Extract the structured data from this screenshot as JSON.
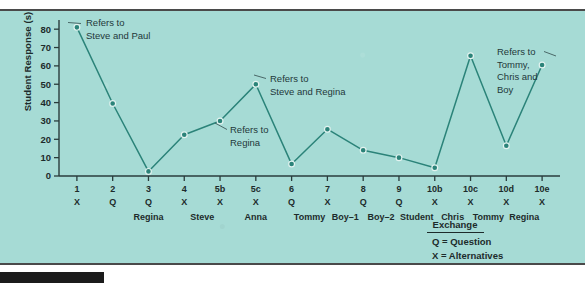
{
  "figure": {
    "background_color": "#a6dbd5",
    "line_color": "#2b8379",
    "text_color": "#1d2b2b"
  },
  "chart_data": {
    "type": "line",
    "title": "",
    "xlabel": "",
    "ylabel": "Student Response (s)",
    "ylim": [
      0,
      85
    ],
    "yticks": [
      0,
      10,
      20,
      30,
      40,
      50,
      60,
      70,
      80
    ],
    "grid": false,
    "legend_position": "bottom-right",
    "categories": [
      "1",
      "2",
      "3",
      "4",
      "5b",
      "5c",
      "6",
      "7",
      "8",
      "9",
      "10b",
      "10c",
      "10d",
      "10e"
    ],
    "values": [
      81,
      39.5,
      2.5,
      22.5,
      30,
      50,
      6.5,
      25.5,
      14,
      10,
      4.5,
      65.5,
      16.5,
      60.5
    ],
    "exchange_types": [
      "X",
      "Q",
      "Q",
      "X",
      "X",
      "X",
      "Q",
      "X",
      "Q",
      "Q",
      "X",
      "X",
      "X",
      "X"
    ],
    "speakers": [
      "",
      "",
      "Regina",
      "",
      "Steve",
      "",
      "Anna",
      "Tommy",
      "Boy–1",
      "Boy–2",
      "Student",
      "Chris",
      "Tommy",
      "Regina"
    ],
    "speaker_groups": [
      {
        "label": "Regina",
        "center_category": 2.5
      },
      {
        "label": "Steve",
        "center_category": 4
      },
      {
        "label": "Anna",
        "center_category": 5.5
      },
      {
        "label": "Tommy",
        "center_category": 7
      },
      {
        "label": "Boy–1",
        "center_category": 8
      },
      {
        "label": "Boy–2",
        "center_category": 9
      },
      {
        "label": "Student",
        "center_category": 10
      },
      {
        "label": "Chris",
        "center_category": 11
      },
      {
        "label": "Tommy",
        "center_category": 12
      },
      {
        "label": "Regina",
        "center_category": 13
      }
    ],
    "annotations": [
      {
        "name": "annotation-steve-paul",
        "lines": [
          "Refers to",
          "Steve and Paul"
        ],
        "target_category": "1",
        "target_value": 81
      },
      {
        "name": "annotation-regina",
        "lines": [
          "Refers to",
          "Regina"
        ],
        "target_category": "5b",
        "target_value": 30
      },
      {
        "name": "annotation-steve-regina",
        "lines": [
          "Refers to",
          "Steve and Regina"
        ],
        "target_category": "5c",
        "target_value": 50
      },
      {
        "name": "annotation-tommy-chris-boy",
        "lines": [
          "Refers to",
          "Tommy,",
          "Chris and",
          "Boy"
        ],
        "target_category": "10e",
        "target_value": 60.5
      }
    ],
    "legend": {
      "title": "Exchange",
      "entries": [
        {
          "symbol": "Q",
          "equals": "=",
          "label": "Question"
        },
        {
          "symbol": "X",
          "equals": "=",
          "label": "Alternatives"
        }
      ]
    }
  }
}
